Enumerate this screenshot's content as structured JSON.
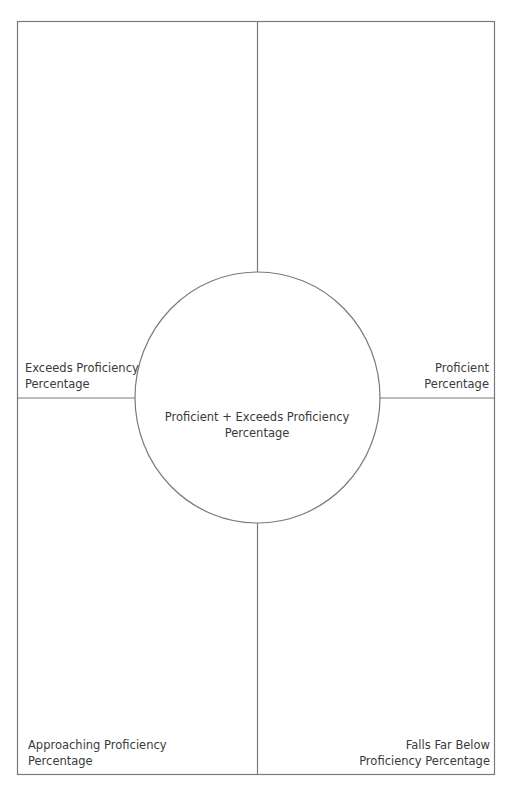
{
  "organizer": {
    "type": "four-square graphic organizer",
    "quadrants": {
      "top_left": {
        "line1": "Exceeds Proficiency",
        "line2": "Percentage"
      },
      "top_right": {
        "line1": "Proficient",
        "line2": "Percentage"
      },
      "bottom_left": {
        "line1": "Approaching Proficiency",
        "line2": "Percentage"
      },
      "bottom_right": {
        "line1": "Falls Far Below",
        "line2": "Proficiency Percentage"
      }
    },
    "center": {
      "line1": "Proficient + Exceeds Proficiency",
      "line2": "Percentage"
    },
    "colors": {
      "line": "#7a7a7a",
      "text": "#3a3a3a",
      "background": "#ffffff"
    }
  }
}
